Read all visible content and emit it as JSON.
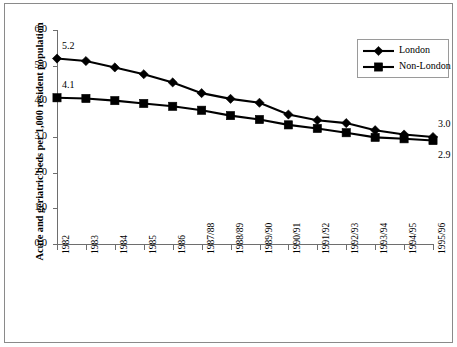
{
  "chart_data": {
    "type": "line",
    "title": "",
    "xlabel": "",
    "ylabel": "Acute and geriatric beds per 1,000 resident population",
    "categories": [
      "1982",
      "1983",
      "1984",
      "1985",
      "1986",
      "1987/88",
      "1988/89",
      "1989/90",
      "1990/91",
      "1991/92",
      "1992/93",
      "1993/94",
      "1994/95",
      "1995/96"
    ],
    "ylim": [
      0.0,
      6.0
    ],
    "ytick_labels": [
      "0.0",
      "1.0",
      "2.0",
      "3.0",
      "4.0",
      "5.0",
      "6.0"
    ],
    "ytick_values": [
      0.0,
      1.0,
      2.0,
      3.0,
      4.0,
      5.0,
      6.0
    ],
    "grid": false,
    "legend_position": "top-right",
    "series": [
      {
        "name": "London",
        "marker": "diamond",
        "values": [
          5.2,
          5.13,
          4.95,
          4.76,
          4.53,
          4.23,
          4.07,
          3.96,
          3.63,
          3.47,
          3.39,
          3.19,
          3.07,
          3.0
        ]
      },
      {
        "name": "Non-London",
        "marker": "square",
        "values": [
          4.1,
          4.08,
          4.02,
          3.94,
          3.86,
          3.75,
          3.6,
          3.49,
          3.34,
          3.24,
          3.12,
          2.99,
          2.95,
          2.9
        ]
      }
    ],
    "annotations": [
      {
        "text": "5.2",
        "series": "London",
        "category": "1982",
        "position": "above-right"
      },
      {
        "text": "4.1",
        "series": "Non-London",
        "category": "1982",
        "position": "above-right"
      },
      {
        "text": "3.0",
        "series": "London",
        "category": "1995/96",
        "position": "above-right"
      },
      {
        "text": "2.9",
        "series": "Non-London",
        "category": "1995/96",
        "position": "below-right"
      }
    ],
    "colors": {
      "series_line": "#000000",
      "axis": "#6e6e6e",
      "frame": "#8a8a8a",
      "background": "#ffffff"
    }
  },
  "legend": {
    "items": [
      {
        "label": "London",
        "marker": "diamond"
      },
      {
        "label": "Non-London",
        "marker": "square"
      }
    ]
  }
}
